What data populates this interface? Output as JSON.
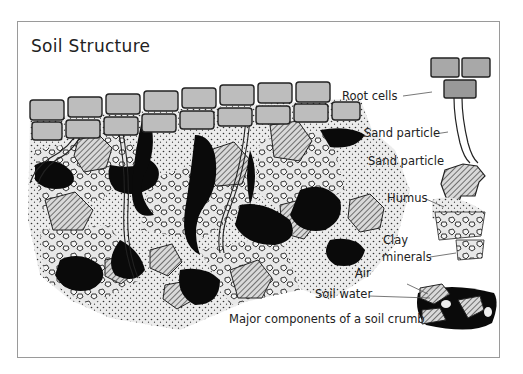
{
  "diagram": {
    "title": "Soil Structure",
    "labels": {
      "root_cells": "Root cells",
      "sand_particle_1": "Sand particle",
      "sand_particle_2": "Sand particle",
      "humus": "Humus",
      "clay_line1": "Clay",
      "clay_line2": "minerals",
      "air": "Air",
      "soil_water": "Soil water",
      "caption": "Major components of a soil crumb"
    }
  }
}
